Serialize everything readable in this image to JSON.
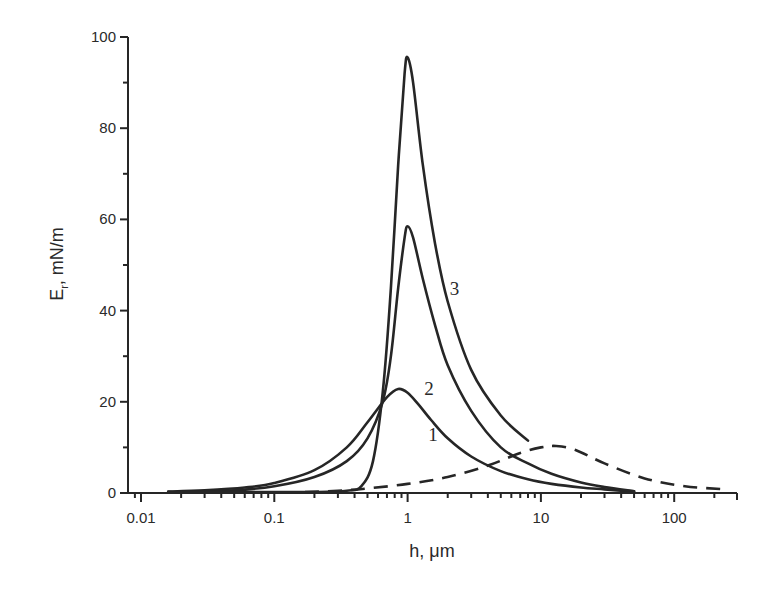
{
  "chart_data": {
    "type": "line",
    "title": "",
    "xlabel": "h, μm",
    "ylabel": "Eᵣ, mN/m",
    "ylabel_main": "E",
    "ylabel_sub": "r",
    "ylabel_unit": ", mN/m",
    "xscale": "log",
    "xlim": [
      0.008,
      300
    ],
    "ylim": [
      0,
      100
    ],
    "grid": false,
    "legend": "none (curves labelled inline 1, 2, 3)",
    "x_ticks": [
      0.01,
      0.1,
      1,
      10,
      100
    ],
    "x_tick_labels": [
      "0.01",
      "0.1",
      "1",
      "10",
      "100"
    ],
    "y_ticks": [
      0,
      20,
      40,
      60,
      80,
      100
    ],
    "y_tick_labels": [
      "0",
      "20",
      "40",
      "60",
      "80",
      "100"
    ],
    "series": [
      {
        "name": "1",
        "style": "solid",
        "x": [
          0.016,
          0.03,
          0.06,
          0.1,
          0.2,
          0.35,
          0.5,
          0.7,
          0.85,
          1.0,
          1.2,
          1.5,
          2,
          3,
          5,
          8,
          12,
          20,
          30,
          50
        ],
        "y": [
          0.3,
          0.6,
          1.2,
          2.2,
          5.0,
          10.0,
          15.5,
          21.0,
          22.8,
          22.0,
          19.5,
          16.0,
          12.0,
          8.0,
          4.8,
          3.0,
          2.0,
          1.2,
          0.8,
          0.3
        ]
      },
      {
        "name": "2",
        "style": "solid",
        "x": [
          0.016,
          0.05,
          0.1,
          0.2,
          0.35,
          0.5,
          0.65,
          0.75,
          0.85,
          0.95,
          1.0,
          1.1,
          1.3,
          1.6,
          2,
          3,
          5,
          8,
          12,
          20,
          30,
          50
        ],
        "y": [
          0.2,
          0.6,
          1.5,
          3.5,
          7.0,
          12.0,
          20.0,
          30.0,
          45.0,
          56.0,
          58.5,
          56.0,
          47.0,
          37.0,
          28.0,
          18.0,
          10.0,
          6.5,
          4.2,
          2.3,
          1.3,
          0.4
        ]
      },
      {
        "name": "3",
        "style": "solid",
        "x": [
          0.016,
          0.1,
          0.2,
          0.35,
          0.45,
          0.55,
          0.65,
          0.75,
          0.85,
          0.95,
          1.0,
          1.1,
          1.3,
          1.6,
          2,
          3,
          5,
          8
        ],
        "y": [
          0.0,
          0.0,
          0.2,
          0.5,
          1.5,
          7.0,
          22.0,
          45.0,
          72.0,
          92.0,
          95.5,
          90.0,
          72.0,
          55.0,
          42.0,
          27.0,
          17.0,
          11.5
        ]
      },
      {
        "name": "dashed",
        "style": "dashed",
        "x": [
          0.17,
          0.3,
          0.5,
          1,
          2,
          4,
          7,
          10,
          13,
          18,
          30,
          60,
          120,
          250
        ],
        "y": [
          0.2,
          0.5,
          1.0,
          2.0,
          3.5,
          6.0,
          8.8,
          10.0,
          10.3,
          9.5,
          6.5,
          3.2,
          1.5,
          0.8
        ]
      }
    ],
    "annotations": [
      {
        "text": "1",
        "x": 1.55,
        "y": 11.5
      },
      {
        "text": "2",
        "x": 1.45,
        "y": 21.5
      },
      {
        "text": "3",
        "x": 2.25,
        "y": 43.5
      }
    ]
  }
}
